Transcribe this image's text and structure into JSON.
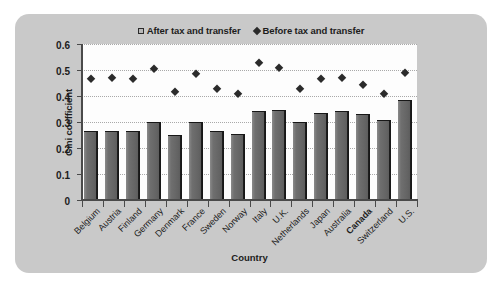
{
  "chart_data": {
    "type": "bar",
    "title": "",
    "xlabel": "Country",
    "ylabel": "Gini coefficient",
    "ylim": [
      0,
      0.6
    ],
    "ytick_labels": [
      "0.6",
      "0.5",
      "0.4",
      "0.3",
      "0.2",
      "0.1",
      "0"
    ],
    "ytick_values": [
      0.6,
      0.5,
      0.4,
      0.3,
      0.2,
      0.1,
      0
    ],
    "grid": "horizontal dotted gridlines at 0.1 intervals",
    "legend_position": "top-center",
    "categories": [
      "Belgium",
      "Austria",
      "Finland",
      "Germany",
      "Denmark",
      "France",
      "Sweden",
      "Norway",
      "Italy",
      "U.K.",
      "Netherlands",
      "Japan",
      "Australia",
      "Canada",
      "Switzerland",
      "U.S."
    ],
    "highlighted_category": "Canada",
    "series": [
      {
        "name": "After tax and transfer",
        "marker": "square",
        "render": "bar",
        "color": "#6b6b6b",
        "values": [
          0.26,
          0.263,
          0.261,
          0.297,
          0.248,
          0.295,
          0.262,
          0.25,
          0.339,
          0.344,
          0.298,
          0.331,
          0.339,
          0.327,
          0.304,
          0.38
        ]
      },
      {
        "name": "Before tax and transfer",
        "marker": "diamond",
        "render": "point",
        "color": "#2b2b2b",
        "values": [
          0.466,
          0.469,
          0.464,
          0.505,
          0.415,
          0.485,
          0.426,
          0.408,
          0.528,
          0.506,
          0.426,
          0.464,
          0.469,
          0.441,
          0.408,
          0.488
        ]
      }
    ]
  },
  "legend": {
    "entries": [
      {
        "label": "After tax and transfer",
        "marker": "square-marker"
      },
      {
        "label": "Before tax and transfer",
        "marker": "diamond-marker"
      }
    ]
  }
}
